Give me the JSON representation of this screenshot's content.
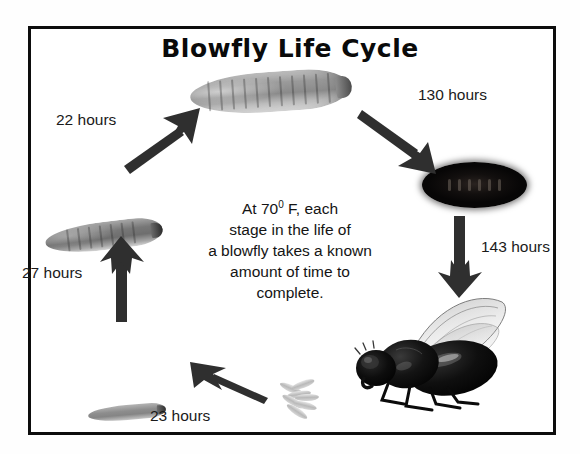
{
  "diagram": {
    "title": "Blowfly Life Cycle",
    "border_color": "#0d0d0d",
    "background_color": "#ffffff",
    "arrow_color": "#2f2f2f",
    "center_text": {
      "line1_pre": "At 70",
      "line1_sup": "0",
      "line1_post": " F, each",
      "line2": "stage in the life of",
      "line3": "a blowfly takes a known",
      "line4": "amount of time to",
      "line5": "complete."
    },
    "labels": {
      "eggs_to_first_instar": "23 hours",
      "first_to_second_instar": "27 hours",
      "second_to_third_instar": "22 hours",
      "third_instar_to_pupa": "130 hours",
      "pupa_to_adult": "143 hours"
    },
    "stages": [
      {
        "name": "eggs",
        "label": "eggs"
      },
      {
        "name": "first-instar-larva",
        "label": "first instar larva"
      },
      {
        "name": "second-instar-larva",
        "label": "second instar larva"
      },
      {
        "name": "third-instar-larva",
        "label": "third instar larva"
      },
      {
        "name": "pupa",
        "label": "pupa"
      },
      {
        "name": "adult-blowfly",
        "label": "adult blowfly"
      }
    ]
  }
}
